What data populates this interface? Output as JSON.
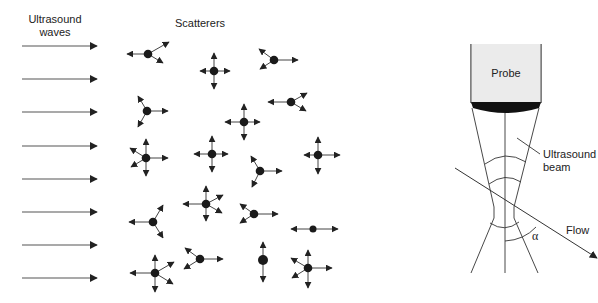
{
  "left_panel": {
    "waves_label_line1": "Ultrasound",
    "waves_label_line2": "waves",
    "scatterers_label": "Scatterers",
    "wave_count": 8,
    "scatterer_count": 18
  },
  "right_panel": {
    "probe_label": "Probe",
    "beam_label_line1": "Ultrasound",
    "beam_label_line2": "beam",
    "flow_label": "Flow",
    "angle_label": "α"
  },
  "colors": {
    "ink": "#222222",
    "probe_fill": "#ebebeb",
    "lens_fill": "#111111"
  }
}
